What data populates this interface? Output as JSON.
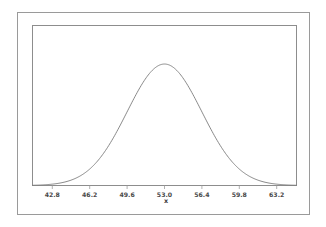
{
  "figure": {
    "background_color": "#ffffff",
    "outer_frame_color": "#9a9a9a",
    "plot_box_color": "#8d8d8d"
  },
  "chart_data": {
    "type": "line",
    "title": "",
    "subtitle": "",
    "xlabel": "x",
    "ylabel": "",
    "grid": false,
    "legend": null,
    "curve_color": "#7c7c7c",
    "distribution": {
      "shape": "normal",
      "mean": 53.0,
      "sigma": 3.4
    },
    "xlim": [
      41.0,
      65.0
    ],
    "ylim": [
      0,
      0.125
    ],
    "xticks": [
      42.8,
      46.2,
      49.6,
      53.0,
      56.4,
      59.8,
      63.2
    ],
    "xticklabels": [
      "42.8",
      "46.2",
      "49.6",
      "53.0",
      "56.4",
      "59.8",
      "63.2"
    ],
    "yticks": [],
    "yticklabels": [],
    "x": [
      42.0,
      42.4,
      42.8,
      43.2,
      43.6,
      44.0,
      44.4,
      44.8,
      45.2,
      45.6,
      46.0,
      46.4,
      46.8,
      47.2,
      47.6,
      48.0,
      48.4,
      48.8,
      49.2,
      49.6,
      50.0,
      50.4,
      50.8,
      51.2,
      51.6,
      52.0,
      52.4,
      52.8,
      53.0,
      53.2,
      53.6,
      54.0,
      54.4,
      54.8,
      55.2,
      55.6,
      56.0,
      56.4,
      56.8,
      57.2,
      57.6,
      58.0,
      58.4,
      58.8,
      59.2,
      59.6,
      60.0,
      60.4,
      60.8,
      61.2,
      61.6,
      62.0,
      62.4,
      62.8,
      63.2,
      63.6,
      64.0
    ],
    "y": [
      0.0022,
      0.0031,
      0.0043,
      0.0058,
      0.0077,
      0.0101,
      0.013,
      0.0165,
      0.0206,
      0.0253,
      0.0307,
      0.0366,
      0.043,
      0.0497,
      0.0566,
      0.0634,
      0.07,
      0.0762,
      0.0817,
      0.0864,
      0.0901,
      0.0928,
      0.0944,
      0.0949,
      0.0944,
      0.0928,
      0.0901,
      0.0864,
      0.0949,
      0.0864,
      0.0817,
      0.0762,
      0.07,
      0.0634,
      0.0566,
      0.0497,
      0.043,
      0.0366,
      0.0307,
      0.0253,
      0.0206,
      0.0165,
      0.013,
      0.0101,
      0.0077,
      0.0058,
      0.0043,
      0.0031,
      0.0022,
      0.0016,
      0.0011,
      0.0007,
      0.0005,
      0.0003,
      0.0002,
      0.0001,
      0.0001
    ]
  }
}
